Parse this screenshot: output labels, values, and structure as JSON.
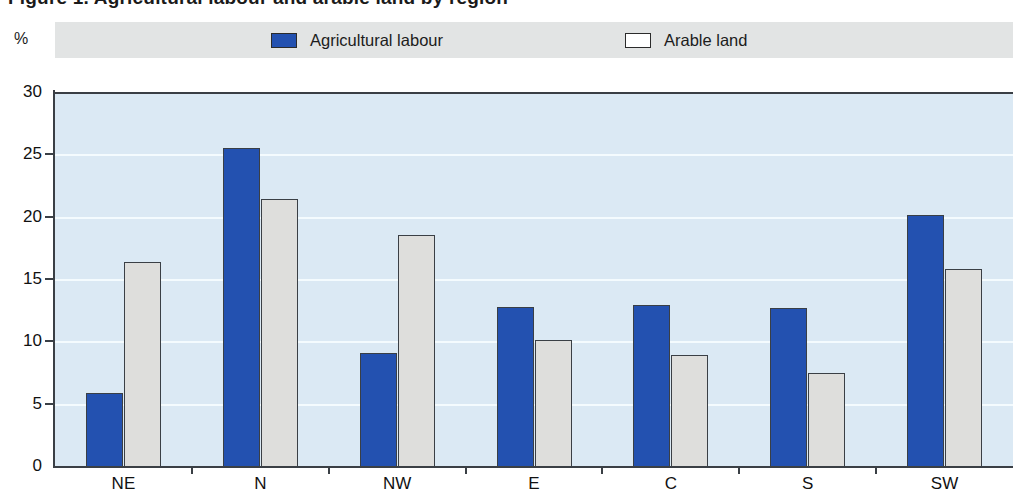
{
  "title": {
    "text": "Figure 1. Agricultural labour and arable land by region",
    "clipped": true
  },
  "axis_unit_label": "%",
  "legend": [
    {
      "label": "Agricultural labour",
      "swatch": "legend-swatch-blue",
      "color": "#2351b0"
    },
    {
      "label": "Arable land",
      "swatch": "legend-swatch-white",
      "color": "#ffffff"
    }
  ],
  "colors": {
    "series_blue": "#2351b0",
    "series_grey": "#dededc",
    "plot_background": "#dbe9f4",
    "legend_band": "#e2e4e4",
    "axis": "#3a3f45",
    "gridline": "#f4fbfe"
  },
  "chart_data": {
    "type": "bar",
    "title": "Agricultural labour and arable land by region",
    "xlabel": "",
    "ylabel": "%",
    "ylim": [
      0,
      30
    ],
    "yticks": [
      0,
      5,
      10,
      15,
      20,
      25,
      30
    ],
    "grid": true,
    "legend_position": "top",
    "categories": [
      "NE",
      "N",
      "NW",
      "E",
      "C",
      "S",
      "SW"
    ],
    "series": [
      {
        "name": "Agricultural labour",
        "color": "#2351b0",
        "values": [
          6.0,
          25.7,
          9.2,
          12.9,
          13.1,
          12.8,
          20.3
        ]
      },
      {
        "name": "Arable land",
        "color": "#dededc",
        "values": [
          16.5,
          21.6,
          18.7,
          10.3,
          9.1,
          7.6,
          16.0
        ]
      }
    ]
  }
}
